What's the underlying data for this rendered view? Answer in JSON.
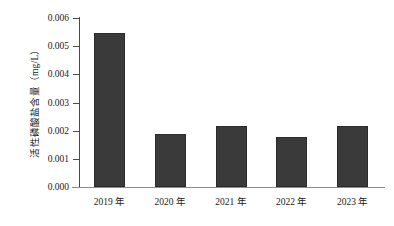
{
  "chart_data": {
    "type": "bar",
    "title": "",
    "subtitle": "",
    "xlabel": "",
    "ylabel": "活性磷酸盐含量（mg/L）",
    "categories": [
      "2019 年",
      "2020 年",
      "2021 年",
      "2022 年",
      "2023 年"
    ],
    "values": [
      0.00547,
      0.00188,
      0.00217,
      0.00178,
      0.00217
    ],
    "series": [
      {
        "name": "活性磷酸盐含量",
        "values": [
          0.00547,
          0.00188,
          0.00217,
          0.00178,
          0.00217
        ]
      }
    ],
    "ylim": [
      0.0,
      0.006
    ],
    "ytick_values": [
      0.0,
      0.001,
      0.002,
      0.003,
      0.004,
      0.005,
      0.006
    ],
    "ytick_labels": [
      "0.000",
      "0.001",
      "0.002",
      "0.003",
      "0.004",
      "0.005",
      "0.006"
    ],
    "grid": false,
    "legend": false,
    "legend_position": "none",
    "bar_color": "#3a3a3a",
    "axis_color": "#4a4a4a",
    "background_color": "#ffffff"
  },
  "axes": {
    "y_title": "活性磷酸盐含量（mg/L）",
    "ticks": [
      {
        "label": "0.006",
        "value": 0.006
      },
      {
        "label": "0.005",
        "value": 0.005
      },
      {
        "label": "0.004",
        "value": 0.004
      },
      {
        "label": "0.003",
        "value": 0.003
      },
      {
        "label": "0.002",
        "value": 0.002
      },
      {
        "label": "0.001",
        "value": 0.001
      },
      {
        "label": "0.000",
        "value": 0.0
      }
    ]
  },
  "bars": [
    {
      "label": "2019 年",
      "value": 0.00547
    },
    {
      "label": "2020 年",
      "value": 0.00188
    },
    {
      "label": "2021 年",
      "value": 0.00217
    },
    {
      "label": "2022 年",
      "value": 0.00178
    },
    {
      "label": "2023 年",
      "value": 0.00217
    }
  ]
}
